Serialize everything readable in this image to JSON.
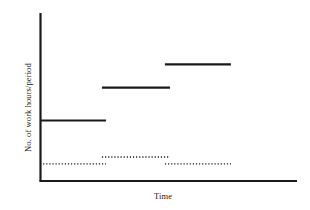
{
  "chart_data": {
    "type": "line",
    "title": "",
    "subtitle": "",
    "xlabel": "Time",
    "ylabel": "No. of work hours/period",
    "grid": false,
    "legend": null,
    "xlim": [
      0,
      100
    ],
    "ylim": [
      0,
      100
    ],
    "axis_ticks": {
      "x": [],
      "y": []
    },
    "series": [
      {
        "name": "Work hours per period",
        "style": "solid",
        "color": "#1a1a1a",
        "steps": [
          {
            "label": "step-1",
            "x_start": 0.0,
            "x_end": 25.7,
            "y": 36.0
          },
          {
            "label": "step-2",
            "x_start": 24.1,
            "x_end": 50.6,
            "y": 55.6
          },
          {
            "label": "step-3",
            "x_start": 48.6,
            "x_end": 74.3,
            "y": 69.4
          }
        ]
      },
      {
        "name": "Reference level",
        "style": "dotted",
        "color": "#1a1a1a",
        "steps": [
          {
            "label": "dotted-1",
            "x_start": 0.0,
            "x_end": 25.7,
            "y": 10.2
          },
          {
            "label": "dotted-2",
            "x_start": 24.1,
            "x_end": 50.6,
            "y": 14.3
          },
          {
            "label": "dotted-3",
            "x_start": 48.6,
            "x_end": 74.3,
            "y": 10.2
          }
        ]
      }
    ]
  },
  "axes": {
    "x_axis_label": "Time",
    "y_axis_label": "No. of work hours/period",
    "line_color": "#1a1a1a"
  }
}
